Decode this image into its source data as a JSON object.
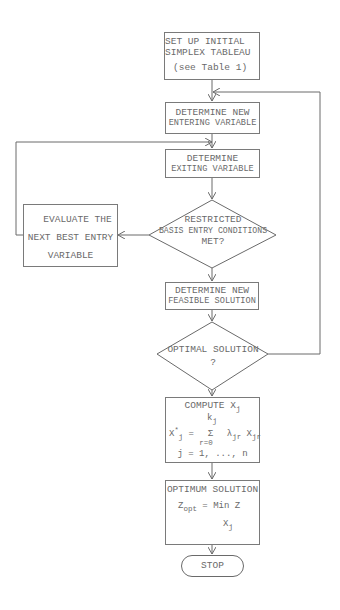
{
  "flowchart": {
    "title": "Restricted basis entry simplex procedure",
    "nodes": {
      "start": {
        "lines": [
          "SET UP INITIAL",
          "SIMPLEX TABLEAU",
          "(see Table 1)"
        ]
      },
      "entering": {
        "lines": [
          "DETERMINE NEW",
          "ENTERING VARIABLE"
        ]
      },
      "exiting": {
        "lines": [
          "DETERMINE",
          "EXITING VARIABLE"
        ]
      },
      "restricted_decision": {
        "lines": [
          "RESTRICTED",
          "BASIS ENTRY CONDITIONS",
          "MET?"
        ]
      },
      "evaluate": {
        "lines": [
          "EVALUATE THE",
          "NEXT BEST ENTRY",
          "VARIABLE"
        ]
      },
      "feasible": {
        "lines": [
          "DETERMINE NEW",
          "FEASIBLE SOLUTION"
        ]
      },
      "optimal_decision": {
        "lines": [
          "OPTIMAL SOLUTION",
          "?"
        ]
      },
      "compute": {
        "title": "COMPUTE X",
        "title_sub": "j",
        "upper_limit": "k",
        "upper_limit_sub": "j",
        "lhs": "X",
        "lhs_sup": "*",
        "lhs_sub": "j",
        "equals": "=",
        "sum_symbol": "Σ",
        "sum_lower": "r=0",
        "lambda": "λ",
        "lambda_sub": "jr",
        "x": "X",
        "x_sub": "jr",
        "range": "j = 1, ..., n"
      },
      "optimum": {
        "title": "OPTIMUM SOLUTION",
        "z": "Z",
        "z_sub": "opt",
        "rhs": "= Min Z",
        "under": "X",
        "under_sub": "j"
      },
      "stop": {
        "label": "STOP"
      }
    },
    "colors": {
      "line": "#6a6a6a",
      "text": "#6a6a6a",
      "background": "#ffffff"
    }
  }
}
